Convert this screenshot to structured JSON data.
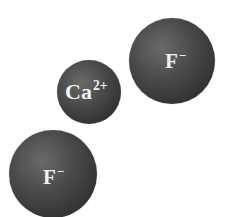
{
  "diagram": {
    "title": "",
    "background": "#ffffff",
    "ions": [
      {
        "id": "fluoride-top",
        "symbol": "F",
        "charge": "−",
        "cx": 172,
        "cy": 61,
        "r": 43,
        "color": "#444444",
        "label_color": "#f2f2f2"
      },
      {
        "id": "calcium",
        "symbol": "Ca",
        "charge": "2+",
        "cx": 89,
        "cy": 92,
        "r": 32,
        "color": "#444444",
        "label_color": "#f2f2f2"
      },
      {
        "id": "fluoride-bottom",
        "symbol": "F",
        "charge": "−",
        "cx": 53,
        "cy": 174,
        "r": 44,
        "color": "#444444",
        "label_color": "#f2f2f2"
      }
    ]
  }
}
